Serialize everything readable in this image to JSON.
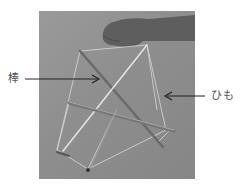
{
  "figure": {
    "labels": {
      "rod": "棒",
      "string": "ひも"
    },
    "colors": {
      "background": "#ffffff",
      "photo_bg": "#8f8f8f",
      "label_text": "#555555",
      "arrow": "#222222"
    }
  }
}
